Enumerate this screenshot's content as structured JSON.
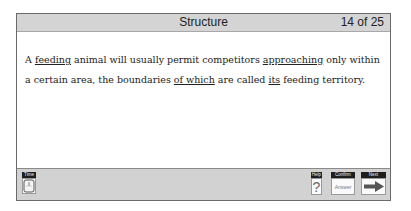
{
  "header": {
    "title": "Structure",
    "progress": "14 of 25"
  },
  "question": {
    "segments": [
      {
        "text": "A ",
        "underline": false
      },
      {
        "text": "feeding",
        "underline": true
      },
      {
        "text": " animal will usually permit competitors ",
        "underline": false
      },
      {
        "text": "approaching",
        "underline": true
      },
      {
        "text": " only within a certain area, the boundaries ",
        "underline": false
      },
      {
        "text": "of which",
        "underline": true
      },
      {
        "text": " are called ",
        "underline": false
      },
      {
        "text": "its",
        "underline": true
      },
      {
        "text": " feeding territory.",
        "underline": false
      }
    ]
  },
  "footer": {
    "time_label": "Time",
    "help_label": "Help",
    "help_glyph": "?",
    "confirm_label": "Confirm",
    "confirm_text": "Answer",
    "next_label": "Next"
  }
}
